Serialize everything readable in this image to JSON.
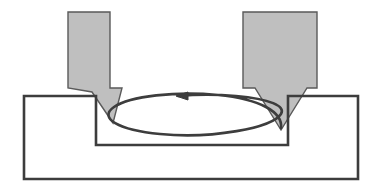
{
  "diagram": {
    "title": "Machining tool path diagram",
    "background_color": "#ffffff",
    "canvas": {
      "width": 379,
      "height": 191
    }
  },
  "style": {
    "tool_fill": "#BFBFBF",
    "tool_stroke": "#5A5A5A",
    "tool_stroke_width": 1.4,
    "workpiece_fill": "none",
    "workpiece_stroke": "#3D3D3D",
    "workpiece_stroke_width": 2.6,
    "arrow_stroke": "#3D3D3D",
    "arrow_stroke_width": 2.6,
    "arrow_fill": "none"
  },
  "shapes": {
    "left_tool": {
      "label": "left-cutting-tool",
      "points": "68,12 110,12 110,88 122,88 113,123 92,92 68,88",
      "body_rect": {
        "x": 68,
        "y": 12,
        "width": 42,
        "height": 76
      },
      "tip_point": {
        "x": 113,
        "y": 123
      }
    },
    "right_tool": {
      "label": "right-cutting-tool",
      "points": "243,12 317,12 317,88 307,88 281,130 255,88 243,88",
      "body_rect": {
        "x": 243,
        "y": 12,
        "width": 74,
        "height": 76
      },
      "tip_point": {
        "x": 281,
        "y": 130
      }
    },
    "workpiece": {
      "label": "workpiece-cross-section",
      "outline": "24,96 96,96 96,145 288,145 288,96 358,96 358,179 24,179 24,96",
      "outer_rect": {
        "x": 24,
        "y": 96,
        "width": 334,
        "height": 83
      },
      "groove": {
        "x": 96,
        "y": 96,
        "width": 192,
        "height": 49
      }
    },
    "tool_path_arrow": {
      "label": "tool-path-arrow",
      "curve": "M 281,128 C 283,112 260,99 218,95 C 176,91 130,96 114,107 C 98,118 118,130 160,134 C 212,139 272,128 281,114 C 286,106 270,99 236,96 C 212,94 190,95 178,96",
      "arrow_tip": {
        "x": 176,
        "y": 96
      },
      "arrow_direction": "left",
      "arrow_head_points": "176,96 188,92 188,100"
    }
  },
  "labels": []
}
